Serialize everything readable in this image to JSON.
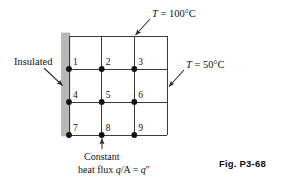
{
  "figure": {
    "number_label": "Fig. P3-68",
    "type": "finite-difference-nodal-grid",
    "background_color": "#ffffff",
    "line_color": "#3a3a3a",
    "node_color": "#111111",
    "insulation_fill": "#b8b8b8"
  },
  "grid": {
    "columns": 3,
    "rows": 3,
    "left": 69,
    "top": 36,
    "right": 167,
    "bottom": 135,
    "cell_width": 32.7,
    "cell_height": 33,
    "vertical_line_x": [
      69,
      101.7,
      134.3,
      167
    ],
    "horizontal_line_y": [
      36,
      69,
      102,
      135
    ]
  },
  "nodes": [
    {
      "id": "1",
      "label": "1",
      "x": 69,
      "y": 69,
      "label_dx": 4,
      "label_dy": -5
    },
    {
      "id": "2",
      "label": "2",
      "x": 101.7,
      "y": 69,
      "label_dx": 4,
      "label_dy": -5
    },
    {
      "id": "3",
      "label": "3",
      "x": 134.3,
      "y": 69,
      "label_dx": 4,
      "label_dy": -5
    },
    {
      "id": "4",
      "label": "4",
      "x": 69,
      "y": 102,
      "label_dx": 4,
      "label_dy": -5
    },
    {
      "id": "5",
      "label": "5",
      "x": 101.7,
      "y": 102,
      "label_dx": 4,
      "label_dy": -5
    },
    {
      "id": "6",
      "label": "6",
      "x": 134.3,
      "y": 102,
      "label_dx": 4,
      "label_dy": -5
    },
    {
      "id": "7",
      "label": "7",
      "x": 69,
      "y": 135,
      "label_dx": 4,
      "label_dy": -5
    },
    {
      "id": "8",
      "label": "8",
      "x": 101.7,
      "y": 135,
      "label_dx": 4,
      "label_dy": -5
    },
    {
      "id": "9",
      "label": "9",
      "x": 134.3,
      "y": 135,
      "label_dx": 4,
      "label_dy": -5
    }
  ],
  "boundary_conditions": {
    "top": {
      "name": "top-temperature",
      "symbol": "T",
      "equals": " = ",
      "value": "100",
      "degree": "°",
      "unit": "C",
      "text": "T = 100°C",
      "label_x": 152,
      "label_y": 9,
      "arrow_from": [
        150,
        19
      ],
      "arrow_to": [
        134,
        36
      ]
    },
    "right": {
      "name": "right-temperature",
      "symbol": "T",
      "equals": " = ",
      "value": "50",
      "degree": "°",
      "unit": "C",
      "text": "T = 50°C",
      "label_x": 186,
      "label_y": 60,
      "arrow_from": [
        184,
        70
      ],
      "arrow_to": [
        168,
        87
      ]
    },
    "left": {
      "name": "insulated-surface",
      "text": "Insulated",
      "label_x": 14,
      "label_y": 57,
      "arrow_from": [
        44,
        68
      ],
      "arrow_to": [
        63,
        86
      ]
    },
    "bottom": {
      "name": "constant-heat-flux",
      "line1": "Constant",
      "line2_prefix": "heat flux ",
      "line2_q": "q",
      "line2_mid": "/A = ",
      "line2_q2": "q",
      "line2_primes": "″",
      "text": "Constant heat flux q/A = q″",
      "line1_x": 84,
      "line1_y": 152,
      "line2_x": 78,
      "line2_y": 165,
      "arrow_from": [
        102,
        149
      ],
      "arrow_to": [
        102,
        138
      ]
    }
  },
  "insulation_bar": {
    "x": 61.5,
    "y": 33,
    "width": 8.5,
    "height": 103
  }
}
